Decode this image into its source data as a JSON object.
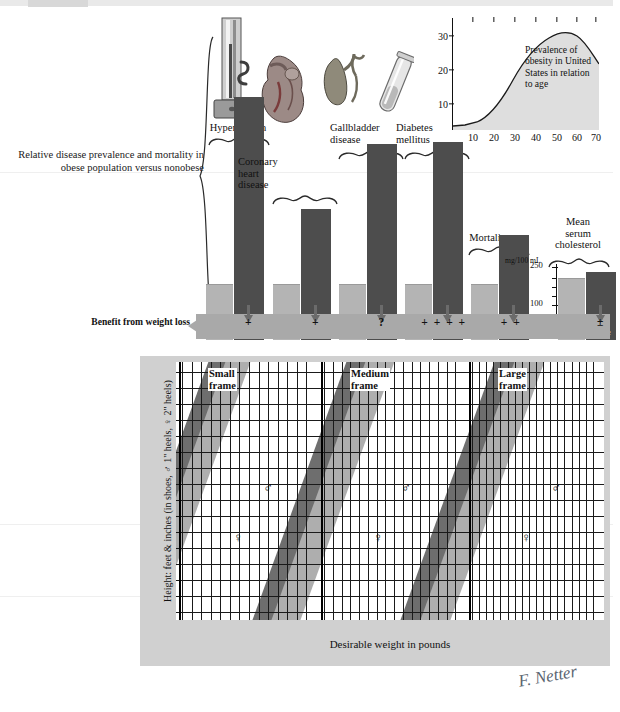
{
  "figure": {
    "left_description": "Relative disease prevalence and mortality in obese population versus nonobese",
    "benefit_label": "Benefit from weight loss",
    "signature": "F. Netter"
  },
  "bar_chart": {
    "non_obese_label_line1": "Non-",
    "non_obese_label_line2": "obese",
    "obese_label": "Obese",
    "cholesterol_axis": {
      "units": "mg/100 mL",
      "ticks": [
        "250",
        "100"
      ]
    },
    "groups": [
      {
        "title": "Hypertension",
        "icon": "sphygmomanometer-icon",
        "non_obese": 20,
        "obese": 88,
        "benefit": "+"
      },
      {
        "title": "Coronary heart disease",
        "icon": "heart-icon",
        "non_obese": 20,
        "obese": 47,
        "benefit": "+"
      },
      {
        "title": "Gallbladder disease",
        "icon": "gallbladder-icon",
        "non_obese": 20,
        "obese": 71,
        "benefit": "?"
      },
      {
        "title": "Diabetes mellitus",
        "icon": "test-tube-icon",
        "non_obese": 20,
        "obese": 72,
        "benefit": "+ + + +"
      },
      {
        "title": "Mortality",
        "icon": "none",
        "non_obese": 20,
        "obese": 38,
        "benefit": "+ +"
      },
      {
        "title": "Mean serum cholesterol",
        "icon": "none",
        "non_obese": 20,
        "obese": 23,
        "benefit": "±"
      }
    ]
  },
  "inset_chart": {
    "caption": "Prevalence of obesity in United States in relation to age"
  },
  "weight_chart": {
    "y_axis_title": "Height: feet & inches (in shoes, ♂ 1\" heels, ♀ 2\" heels)",
    "x_axis_title": "Desirable weight in pounds",
    "y_ticks": [
      "6'3\"",
      "6'2\"",
      "6'1\"",
      "6'0\"",
      "5'11\"",
      "5'10\"",
      "5'9\"",
      "5'8\"",
      "5'7\"",
      "5'6\"",
      "5'5\"",
      "5'4\"",
      "5'3\"",
      "5'2\"",
      "5'1\"",
      "5'0\""
    ],
    "frames": [
      {
        "title_line1": "Small",
        "title_line2": "frame",
        "x_ticks": [
          "105",
          "115",
          "125",
          "135",
          "145",
          "155",
          "165"
        ],
        "female_symbol": "♀",
        "male_symbol": "♂"
      },
      {
        "title_line1": "Medium",
        "title_line2": "frame",
        "x_ticks": [
          "110",
          "120",
          "130",
          "140",
          "150",
          "160",
          "170",
          "180"
        ],
        "female_symbol": "♀",
        "male_symbol": "♂"
      },
      {
        "title_line1": "Large",
        "title_line2": "frame",
        "x_ticks": [
          "115",
          "125",
          "135",
          "145",
          "155",
          "165",
          "175",
          "185",
          "195"
        ],
        "female_symbol": "♀",
        "male_symbol": "♂"
      }
    ]
  },
  "chart_data": [
    {
      "type": "bar",
      "title": "Relative disease prevalence and mortality in obese population versus nonobese",
      "categories": [
        "Hypertension",
        "Coronary heart disease",
        "Gallbladder disease",
        "Diabetes mellitus",
        "Mortality",
        "Mean serum cholesterol"
      ],
      "series": [
        {
          "name": "Non-obese",
          "values": [
            20,
            20,
            20,
            20,
            20,
            20
          ]
        },
        {
          "name": "Obese",
          "values": [
            88,
            47,
            71,
            72,
            38,
            23
          ]
        }
      ],
      "annotations": [
        "+",
        "+",
        "?",
        "+ + + +",
        "+ +",
        "±"
      ],
      "xlabel": "",
      "ylabel": "Relative prevalence",
      "grid": false,
      "legend": "none"
    },
    {
      "type": "area",
      "title": "Prevalence of obesity in United States in relation to age",
      "x": [
        0,
        10,
        15,
        20,
        25,
        30,
        35,
        40,
        45,
        50,
        55,
        60,
        65,
        70
      ],
      "values": [
        1,
        1.5,
        3,
        5,
        8,
        12,
        17,
        21,
        25,
        27,
        28,
        27.5,
        26,
        23
      ],
      "xlabel": "Age (years)",
      "ylabel": "Prevalence (%)",
      "xticks": [
        10,
        20,
        30,
        40,
        50,
        60,
        70
      ],
      "yticks": [
        10,
        20,
        30
      ],
      "xlim": [
        0,
        73
      ],
      "ylim": [
        0,
        32
      ],
      "grid": false,
      "legend": "none"
    },
    {
      "type": "line",
      "title": "Desirable weight ranges by height and frame size",
      "xlabel": "Desirable weight in pounds",
      "ylabel": "Height: feet & inches (in shoes, ♂ 1\" heels, ♀ 2\" heels)",
      "ylim": [
        "5'0\"",
        "6'3\""
      ],
      "grid": true,
      "legend": "none",
      "series": [
        {
          "name": "Small frame — female",
          "x_range": [
            105,
            165
          ],
          "marker_weight": 108,
          "marker_height": "5'11\""
        },
        {
          "name": "Small frame — male",
          "x_range": [
            105,
            165
          ],
          "marker_weight": 138,
          "marker_height": "6'1.5\""
        },
        {
          "name": "Medium frame — female",
          "x_range": [
            110,
            180
          ],
          "marker_weight": 142,
          "marker_height": "5'11\""
        },
        {
          "name": "Medium frame — male",
          "x_range": [
            110,
            180
          ],
          "marker_weight": 160,
          "marker_height": "6'1.5\""
        },
        {
          "name": "Large frame — female",
          "x_range": [
            115,
            195
          ],
          "marker_weight": 157,
          "marker_height": "5'11\""
        },
        {
          "name": "Large frame — male",
          "x_range": [
            115,
            195
          ],
          "marker_weight": 176,
          "marker_height": "6'1.5\""
        }
      ]
    }
  ]
}
